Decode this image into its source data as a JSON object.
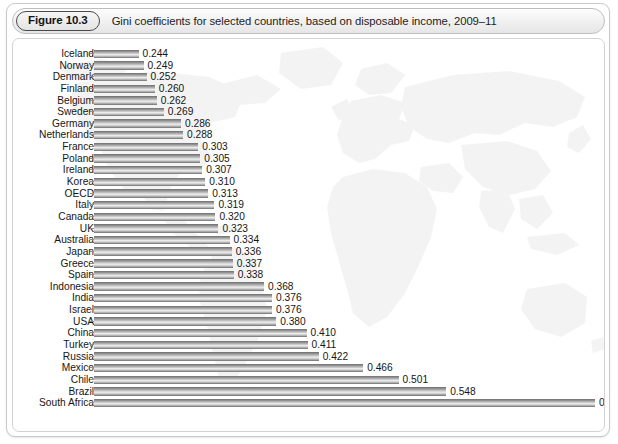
{
  "figure": {
    "badge": "Figure 10.3",
    "caption": "Gini coefficients for selected countries, based on disposable income, 2009–11"
  },
  "chart_data": {
    "type": "bar",
    "orientation": "horizontal",
    "title": "Gini coefficients for selected countries, based on disposable income, 2009–11",
    "xlabel": "",
    "ylabel": "",
    "xlim": [
      0.2,
      0.7
    ],
    "xticks": [
      "0.2",
      "0.3",
      "0.4",
      "0.5",
      "0.6",
      "0.7"
    ],
    "xtick_values": [
      0.2,
      0.3,
      0.4,
      0.5,
      0.6,
      0.7
    ],
    "grid": false,
    "legend": false,
    "bar_color": "#9a9a9a",
    "background_watermark": "world-map",
    "categories": [
      "Iceland",
      "Norway",
      "Denmark",
      "Finland",
      "Belgium",
      "Sweden",
      "Germany",
      "Netherlands",
      "France",
      "Poland",
      "Ireland",
      "Korea",
      "OECD",
      "Italy",
      "Canada",
      "UK",
      "Australia",
      "Japan",
      "Greece",
      "Spain",
      "Indonesia",
      "India",
      "Israel",
      "USA",
      "China",
      "Turkey",
      "Russia",
      "Mexico",
      "Chile",
      "Brazil",
      "South Africa"
    ],
    "values": [
      0.244,
      0.249,
      0.252,
      0.26,
      0.262,
      0.269,
      0.286,
      0.288,
      0.303,
      0.305,
      0.307,
      0.31,
      0.313,
      0.319,
      0.32,
      0.323,
      0.334,
      0.336,
      0.337,
      0.338,
      0.368,
      0.376,
      0.376,
      0.38,
      0.41,
      0.411,
      0.422,
      0.466,
      0.501,
      0.548,
      0.695
    ],
    "value_labels": [
      "0.244",
      "0.249",
      "0.252",
      "0.260",
      "0.262",
      "0.269",
      "0.286",
      "0.288",
      "0.303",
      "0.305",
      "0.307",
      "0.310",
      "0.313",
      "0.319",
      "0.320",
      "0.323",
      "0.334",
      "0.336",
      "0.337",
      "0.338",
      "0.368",
      "0.376",
      "0.376",
      "0.380",
      "0.410",
      "0.411",
      "0.422",
      "0.466",
      "0.501",
      "0.548",
      "0.695"
    ]
  }
}
